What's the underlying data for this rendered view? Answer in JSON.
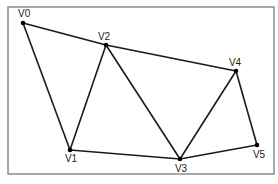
{
  "diagram": {
    "type": "graph",
    "frame": {
      "x": 8,
      "y": 7,
      "width": 266,
      "height": 167,
      "stroke": "#8a8a8a"
    },
    "colors": {
      "edge": "#1a1a1a",
      "vertex": "#000000",
      "label": "#222222",
      "background": "#ffffff"
    },
    "vertices": [
      {
        "id": "V0",
        "label": "V0",
        "x": 23,
        "y": 23,
        "lx": 18,
        "ly": 17,
        "anchor": "start"
      },
      {
        "id": "V1",
        "label": "V1",
        "x": 70,
        "y": 150,
        "lx": 71,
        "ly": 162,
        "anchor": "middle"
      },
      {
        "id": "V2",
        "label": "V2",
        "x": 106,
        "y": 45,
        "lx": 104,
        "ly": 40,
        "anchor": "middle"
      },
      {
        "id": "V3",
        "label": "V3",
        "x": 180,
        "y": 159,
        "lx": 181,
        "ly": 172,
        "anchor": "middle"
      },
      {
        "id": "V4",
        "label": "V4",
        "x": 236,
        "y": 71,
        "lx": 235,
        "ly": 66,
        "anchor": "middle"
      },
      {
        "id": "V5",
        "label": "V5",
        "x": 257,
        "y": 145,
        "lx": 259,
        "ly": 158,
        "anchor": "middle"
      }
    ],
    "edges": [
      [
        "V0",
        "V2"
      ],
      [
        "V2",
        "V4"
      ],
      [
        "V0",
        "V1"
      ],
      [
        "V1",
        "V2"
      ],
      [
        "V2",
        "V3"
      ],
      [
        "V1",
        "V3"
      ],
      [
        "V3",
        "V4"
      ],
      [
        "V3",
        "V5"
      ],
      [
        "V4",
        "V5"
      ]
    ]
  }
}
